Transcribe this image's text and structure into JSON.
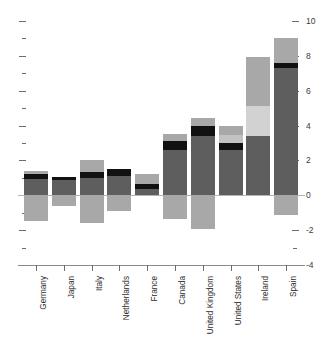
{
  "chart_data": {
    "type": "bar",
    "title": "",
    "subtitle": "",
    "xlabel": "",
    "ylabel": "",
    "ylim": [
      -4,
      10
    ],
    "y_major_ticks": [
      10,
      8,
      6,
      4,
      2,
      0,
      -2,
      -4
    ],
    "y_tick_labels": [
      "10",
      "8",
      "6",
      "4",
      "2",
      "0",
      "-2",
      "-4"
    ],
    "y_minor_step": 1,
    "grid": false,
    "legend": "none",
    "stacked": true,
    "baseline": 0,
    "categories": [
      "Germany",
      "Japan",
      "Italy",
      "Netherlands",
      "France",
      "Canada",
      "United Kingdom",
      "United States",
      "Ireland",
      "Spain"
    ],
    "colors": {
      "dark_gray": "#5e5e5e",
      "black": "#111111",
      "mid_gray": "#a8a8a8",
      "light_gray": "#d2d2d2",
      "axis": "#6d6d6d",
      "zero_line": "#b4b4b4",
      "text": "#2e2e2e"
    },
    "bars": [
      {
        "category": "Germany",
        "segments": [
          {
            "name": "light-gray-top",
            "color": "#a8a8a8",
            "from": 1.0,
            "to": 1.4
          },
          {
            "name": "black-band",
            "color": "#111111",
            "from": 0.95,
            "to": 1.25
          },
          {
            "name": "dark-gray-main",
            "color": "#5e5e5e",
            "from": 0.0,
            "to": 0.95
          },
          {
            "name": "light-gray-neg",
            "color": "#a8a8a8",
            "from": -1.5,
            "to": 0.0
          }
        ]
      },
      {
        "category": "Japan",
        "segments": [
          {
            "name": "black-band",
            "color": "#111111",
            "from": 0.85,
            "to": 1.05
          },
          {
            "name": "dark-gray-main",
            "color": "#5e5e5e",
            "from": 0.0,
            "to": 0.85
          },
          {
            "name": "light-gray-neg",
            "color": "#a8a8a8",
            "from": -0.6,
            "to": 0.0
          }
        ]
      },
      {
        "category": "Italy",
        "segments": [
          {
            "name": "light-gray-top",
            "color": "#a8a8a8",
            "from": 1.3,
            "to": 2.05
          },
          {
            "name": "black-band",
            "color": "#111111",
            "from": 0.98,
            "to": 1.35
          },
          {
            "name": "dark-gray-main",
            "color": "#5e5e5e",
            "from": 0.0,
            "to": 0.98
          },
          {
            "name": "light-gray-neg",
            "color": "#a8a8a8",
            "from": -1.6,
            "to": 0.0
          }
        ]
      },
      {
        "category": "Netherlands",
        "segments": [
          {
            "name": "black-band",
            "color": "#111111",
            "from": 1.1,
            "to": 1.5
          },
          {
            "name": "dark-gray-main",
            "color": "#5e5e5e",
            "from": 0.0,
            "to": 1.1
          },
          {
            "name": "light-gray-neg",
            "color": "#a8a8a8",
            "from": -0.9,
            "to": 0.0
          }
        ]
      },
      {
        "category": "France",
        "segments": [
          {
            "name": "light-gray-top",
            "color": "#a8a8a8",
            "from": 0.6,
            "to": 1.25
          },
          {
            "name": "black-band",
            "color": "#111111",
            "from": 0.35,
            "to": 0.62
          },
          {
            "name": "dark-gray-main",
            "color": "#5e5e5e",
            "from": 0.0,
            "to": 0.35
          }
        ]
      },
      {
        "category": "Canada",
        "segments": [
          {
            "name": "light-gray-top",
            "color": "#a8a8a8",
            "from": 3.1,
            "to": 3.5
          },
          {
            "name": "black-band",
            "color": "#111111",
            "from": 2.6,
            "to": 3.12
          },
          {
            "name": "dark-gray-main",
            "color": "#5e5e5e",
            "from": 0.0,
            "to": 2.6
          },
          {
            "name": "light-gray-neg",
            "color": "#a8a8a8",
            "from": -1.35,
            "to": 0.0
          }
        ]
      },
      {
        "category": "United Kingdom",
        "segments": [
          {
            "name": "light-gray-top",
            "color": "#a8a8a8",
            "from": 3.95,
            "to": 4.45
          },
          {
            "name": "black-band",
            "color": "#111111",
            "from": 3.4,
            "to": 3.97
          },
          {
            "name": "dark-gray-main",
            "color": "#5e5e5e",
            "from": 0.0,
            "to": 3.4
          },
          {
            "name": "light-gray-neg",
            "color": "#a8a8a8",
            "from": -1.95,
            "to": 0.0
          }
        ]
      },
      {
        "category": "United States",
        "segments": [
          {
            "name": "light-gray-top",
            "color": "#a8a8a8",
            "from": 3.45,
            "to": 3.95
          },
          {
            "name": "pale-gray-band",
            "color": "#c2c2c2",
            "from": 3.0,
            "to": 3.47
          },
          {
            "name": "black-band",
            "color": "#111111",
            "from": 2.58,
            "to": 3.02
          },
          {
            "name": "dark-gray-main",
            "color": "#5e5e5e",
            "from": 0.0,
            "to": 2.58
          }
        ]
      },
      {
        "category": "Ireland",
        "segments": [
          {
            "name": "mid-gray-top",
            "color": "#a8a8a8",
            "from": 5.15,
            "to": 7.95
          },
          {
            "name": "pale-gray-band",
            "color": "#d2d2d2",
            "from": 3.4,
            "to": 5.15
          },
          {
            "name": "dark-gray-main",
            "color": "#5e5e5e",
            "from": 0.0,
            "to": 3.4
          }
        ]
      },
      {
        "category": "Spain",
        "segments": [
          {
            "name": "light-gray-top",
            "color": "#a8a8a8",
            "from": 7.55,
            "to": 9.0
          },
          {
            "name": "black-band",
            "color": "#111111",
            "from": 7.28,
            "to": 7.58
          },
          {
            "name": "dark-gray-main",
            "color": "#5e5e5e",
            "from": 0.0,
            "to": 7.28
          },
          {
            "name": "light-gray-neg",
            "color": "#a8a8a8",
            "from": -1.15,
            "to": 0.0
          }
        ]
      }
    ]
  }
}
